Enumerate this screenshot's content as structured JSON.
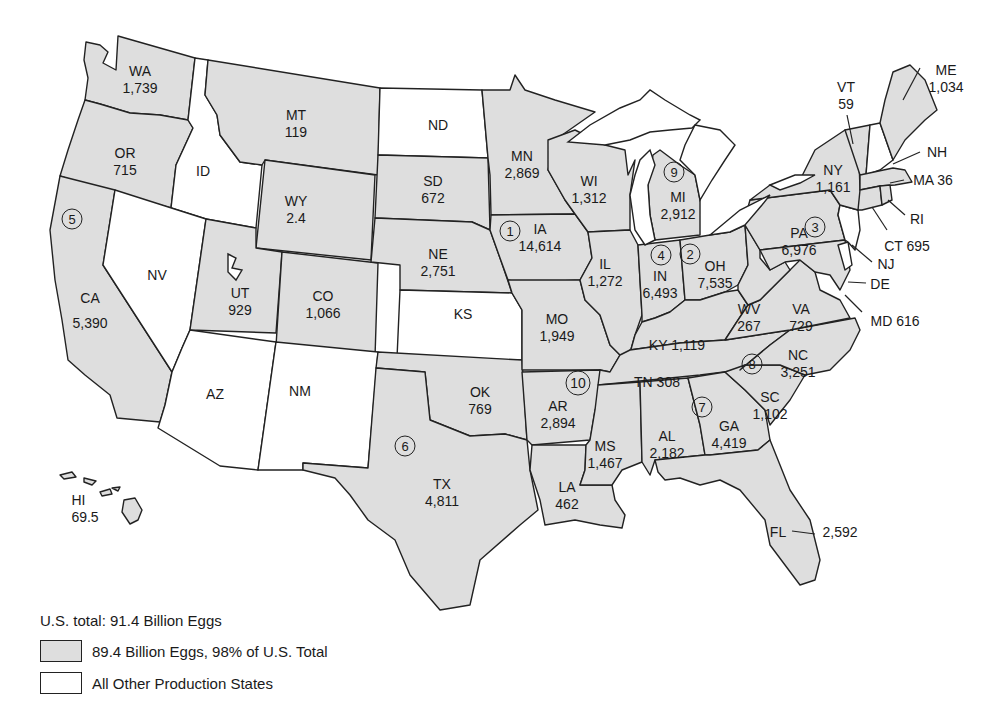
{
  "legend": {
    "total": "U.S. total: 91.4 Billion Eggs",
    "items": [
      {
        "label": "89.4 Billion Eggs, 98% of U.S. Total",
        "color": "#dedede"
      },
      {
        "label": "All Other Production States",
        "color": "#ffffff"
      }
    ]
  },
  "units_note": "Values in million eggs",
  "states": {
    "WA": {
      "abbr": "WA",
      "value": "1,739"
    },
    "OR": {
      "abbr": "OR",
      "value": "715"
    },
    "CA": {
      "abbr": "CA",
      "value": "5,390"
    },
    "ID": {
      "abbr": "ID"
    },
    "NV": {
      "abbr": "NV"
    },
    "MT": {
      "abbr": "MT",
      "value": "119"
    },
    "WY": {
      "abbr": "WY",
      "value": "2.4"
    },
    "UT": {
      "abbr": "UT",
      "value": "929"
    },
    "CO": {
      "abbr": "CO",
      "value": "1,066"
    },
    "AZ": {
      "abbr": "AZ"
    },
    "NM": {
      "abbr": "NM"
    },
    "ND": {
      "abbr": "ND"
    },
    "SD": {
      "abbr": "SD",
      "value": "672"
    },
    "NE": {
      "abbr": "NE",
      "value": "2,751"
    },
    "KS": {
      "abbr": "KS"
    },
    "OK": {
      "abbr": "OK",
      "value": "769"
    },
    "TX": {
      "abbr": "TX",
      "value": "4,811"
    },
    "MN": {
      "abbr": "MN",
      "value": "2,869"
    },
    "IA": {
      "abbr": "IA",
      "value": "14,614"
    },
    "MO": {
      "abbr": "MO",
      "value": "1,949"
    },
    "AR": {
      "abbr": "AR",
      "value": "2,894"
    },
    "LA": {
      "abbr": "LA",
      "value": "462"
    },
    "WI": {
      "abbr": "WI",
      "value": "1,312"
    },
    "IL": {
      "abbr": "IL",
      "value": "1,272"
    },
    "MI": {
      "abbr": "MI",
      "value": "2,912"
    },
    "IN": {
      "abbr": "IN",
      "value": "6,493"
    },
    "OH": {
      "abbr": "OH",
      "value": "7,535"
    },
    "KY": {
      "abbr": "KY",
      "value": "1,119"
    },
    "TN": {
      "abbr": "TN",
      "value": "308"
    },
    "MS": {
      "abbr": "MS",
      "value": "1,467"
    },
    "AL": {
      "abbr": "AL",
      "value": "2,182"
    },
    "GA": {
      "abbr": "GA",
      "value": "4,419"
    },
    "FL": {
      "abbr": "FL",
      "value": "2,592"
    },
    "SC": {
      "abbr": "SC",
      "value": "1,102"
    },
    "NC": {
      "abbr": "NC",
      "value": "3,251"
    },
    "VA": {
      "abbr": "VA",
      "value": "729"
    },
    "WV": {
      "abbr": "WV",
      "value": "267"
    },
    "PA": {
      "abbr": "PA",
      "value": "6,976"
    },
    "NY": {
      "abbr": "NY",
      "value": "1,161"
    },
    "VT": {
      "abbr": "VT",
      "value": "59"
    },
    "NH": {
      "abbr": "NH"
    },
    "ME": {
      "abbr": "ME",
      "value": "1,034"
    },
    "MA": {
      "abbr": "MA",
      "value": "36"
    },
    "RI": {
      "abbr": "RI"
    },
    "CT": {
      "abbr": "CT",
      "value": "695"
    },
    "NJ": {
      "abbr": "NJ"
    },
    "DE": {
      "abbr": "DE"
    },
    "MD": {
      "abbr": "MD",
      "value": "616"
    },
    "HI": {
      "abbr": "HI",
      "value": "69.5"
    }
  },
  "ranks": {
    "IA": "1",
    "OH": "2",
    "PA": "3",
    "IN": "4",
    "CA": "5",
    "TX": "6",
    "GA": "7",
    "NC": "8",
    "MI": "9",
    "AR": "10"
  }
}
